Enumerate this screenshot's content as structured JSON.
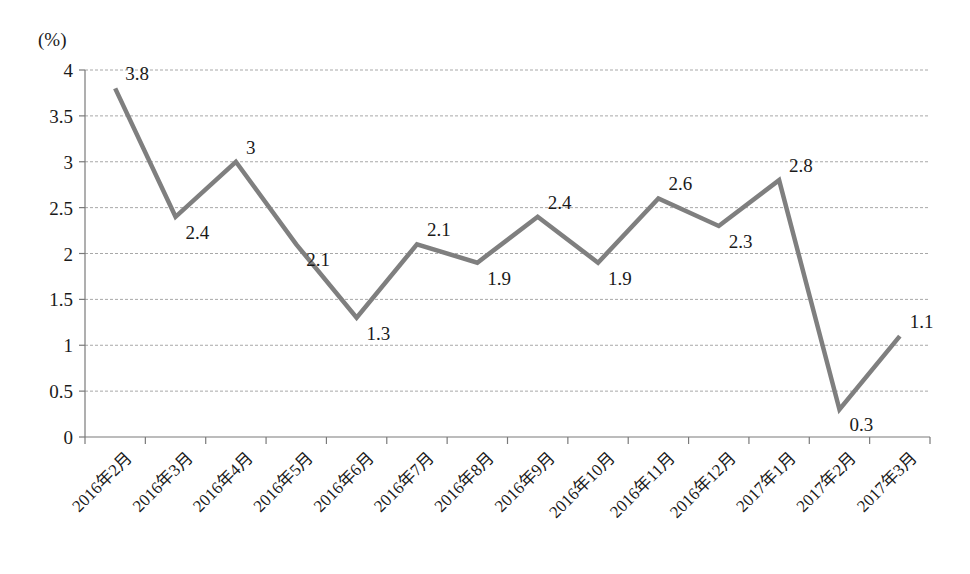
{
  "chart_data": {
    "type": "line",
    "title": "",
    "subtitle": "",
    "xlabel": "",
    "ylabel": "(%)",
    "unit_label": "(%)",
    "ylim": [
      0,
      4
    ],
    "y_ticks": [
      "0",
      "0.5",
      "1",
      "1.5",
      "2",
      "2.5",
      "3",
      "3.5",
      "4"
    ],
    "y_tick_values": [
      0,
      0.5,
      1,
      1.5,
      2,
      2.5,
      3,
      3.5,
      4
    ],
    "grid": true,
    "grid_axis": "y",
    "legend": "none",
    "categories": [
      "2016年2月",
      "2016年3月",
      "2016年4月",
      "2016年5月",
      "2016年6月",
      "2016年7月",
      "2016年8月",
      "2016年9月",
      "2016年10月",
      "2016年11月",
      "2016年12月",
      "2017年1月",
      "2017年2月",
      "2017年3月"
    ],
    "values": [
      3.8,
      2.4,
      3,
      2.1,
      1.3,
      2.1,
      1.9,
      2.4,
      1.9,
      2.6,
      2.3,
      2.8,
      0.3,
      1.1
    ],
    "data_labels": [
      "3.8",
      "2.4",
      "3",
      "2.1",
      "1.3",
      "2.1",
      "1.9",
      "2.4",
      "1.9",
      "2.6",
      "2.3",
      "2.8",
      "0.3",
      "1.1"
    ],
    "series": [
      {
        "name": "",
        "color": "#7f7f7f",
        "values": [
          3.8,
          2.4,
          3,
          2.1,
          1.3,
          2.1,
          1.9,
          2.4,
          1.9,
          2.6,
          2.3,
          2.8,
          0.3,
          1.1
        ]
      }
    ],
    "colors": {
      "line": "#7f7f7f",
      "gridline": "#a8a8a8",
      "axis": "#7a7a7a",
      "text": "#1a1a1a",
      "background": "#ffffff"
    }
  }
}
